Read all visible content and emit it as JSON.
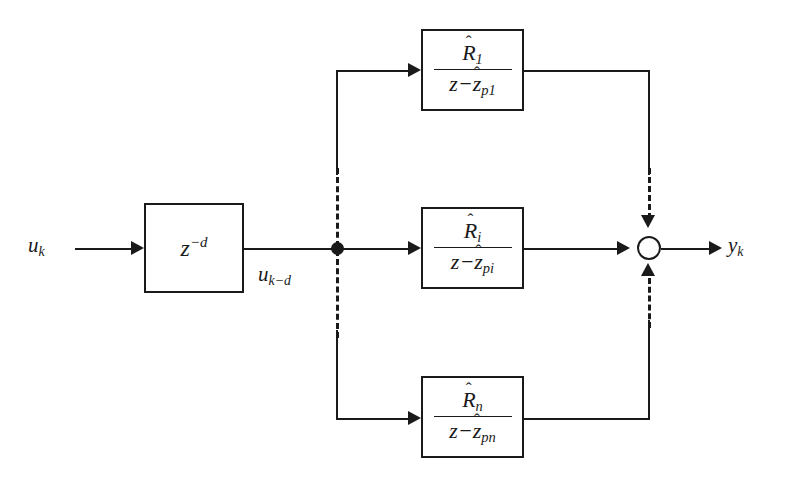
{
  "diagram": {
    "input_signal": "u",
    "input_subscript": "k",
    "delayed_signal": "u",
    "delayed_subscript": "k−d",
    "output_signal": "y",
    "output_subscript": "k",
    "delay_base": "z",
    "delay_exponent": "−d",
    "colors": {
      "line": "#1a1a1a",
      "background": "#ffffff"
    },
    "branches": [
      {
        "name": "branch-1",
        "numerator_symbol": "R",
        "numerator_hat": "ˆ",
        "numerator_subscript": "1",
        "denominator_prefix": "z−",
        "denominator_symbol": "z",
        "denominator_hat": "ˆ",
        "denominator_subscript": "p1"
      },
      {
        "name": "branch-i",
        "numerator_symbol": "R",
        "numerator_hat": "ˆ",
        "numerator_subscript": "i",
        "denominator_prefix": "z−",
        "denominator_symbol": "z",
        "denominator_hat": "ˆ",
        "denominator_subscript": "pi"
      },
      {
        "name": "branch-n",
        "numerator_symbol": "R",
        "numerator_hat": "ˆ",
        "numerator_subscript": "n",
        "denominator_prefix": "z−",
        "denominator_symbol": "z",
        "denominator_hat": "ˆ",
        "denominator_subscript": "pn"
      }
    ]
  }
}
